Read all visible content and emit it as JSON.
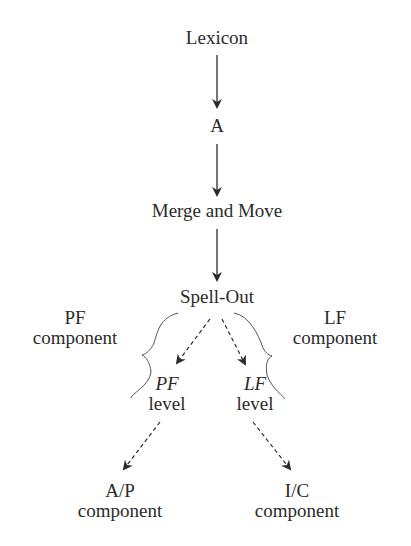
{
  "diagram": {
    "type": "flow",
    "nodes": {
      "lexicon": "Lexicon",
      "a": "A",
      "merge_move": "Merge and Move",
      "spell_out": "Spell-Out",
      "pf_component": {
        "line1": "PF",
        "line2": "component"
      },
      "lf_component": {
        "line1": "LF",
        "line2": "component"
      },
      "pf_level": {
        "line1": "PF",
        "line2": "level"
      },
      "lf_level": {
        "line1": "LF",
        "line2": "level"
      },
      "ap_component": {
        "line1": "A/P",
        "line2": "component"
      },
      "ic_component": {
        "line1": "I/C",
        "line2": "component"
      }
    },
    "edges": [
      {
        "from": "Lexicon",
        "to": "A",
        "style": "solid"
      },
      {
        "from": "A",
        "to": "Merge and Move",
        "style": "solid"
      },
      {
        "from": "Merge and Move",
        "to": "Spell-Out",
        "style": "solid"
      },
      {
        "from": "Spell-Out",
        "to": "PF level",
        "style": "dashed"
      },
      {
        "from": "Spell-Out",
        "to": "LF level",
        "style": "dashed"
      },
      {
        "from": "PF level",
        "to": "A/P component",
        "style": "dashed"
      },
      {
        "from": "LF level",
        "to": "I/C component",
        "style": "dashed"
      }
    ],
    "colors": {
      "ink": "#2b2b2b",
      "background": "#ffffff"
    }
  }
}
